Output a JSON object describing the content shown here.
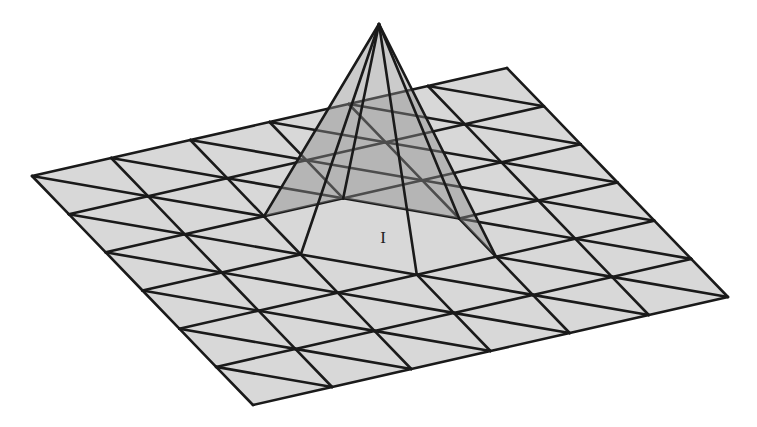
{
  "figure": {
    "node_label": "I",
    "grid": {
      "cells": 6,
      "origin": [
        32,
        176
      ],
      "u_step": [
        79.17,
        -18.0
      ],
      "v_step": [
        36.83,
        38.17
      ],
      "diagonal": "i,j -> i+1,j+1"
    },
    "hat": {
      "center_node": [
        3,
        3
      ],
      "apex": [
        379,
        24
      ],
      "ring": [
        [
          4,
          3
        ],
        [
          4,
          4
        ],
        [
          3,
          4
        ],
        [
          2,
          3
        ],
        [
          2,
          2
        ],
        [
          3,
          2
        ]
      ],
      "back_faces": [
        [
          [
            2,
            2
          ],
          [
            3,
            2
          ]
        ],
        [
          [
            3,
            2
          ],
          [
            4,
            3
          ]
        ],
        [
          [
            4,
            3
          ],
          [
            4,
            4
          ]
        ]
      ]
    },
    "colors": {
      "mesh_fill": "#d8d8d8",
      "shade_fill": "#8c8c8c",
      "shade_opacity": 0.45,
      "line": "#1a1a1a",
      "background": "#ffffff"
    },
    "label_position": [
      383,
      243
    ]
  }
}
